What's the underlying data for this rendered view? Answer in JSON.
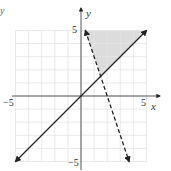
{
  "chart_data": {
    "type": "line",
    "title": "",
    "xlabel": "x",
    "ylabel": "y",
    "xlim": [
      -5,
      5
    ],
    "ylim": [
      -5,
      5
    ],
    "grid": true,
    "x_ticks": [
      "-5",
      "5"
    ],
    "y_ticks": [
      "5",
      "-5"
    ],
    "series": [
      {
        "name": "y = x",
        "style": "solid",
        "points": [
          [
            -5,
            -5
          ],
          [
            5,
            5
          ]
        ]
      },
      {
        "name": "y = -3x + 6",
        "style": "dashed",
        "points": [
          [
            0.333,
            5
          ],
          [
            3.667,
            -5
          ]
        ]
      }
    ],
    "shaded_region": {
      "vertices": [
        [
          0.333,
          5
        ],
        [
          1.5,
          1.5
        ],
        [
          5,
          5
        ]
      ],
      "color": "#dcdcdc"
    },
    "intersection": [
      1.5,
      1.5
    ]
  },
  "labels": {
    "x_axis": "x",
    "y_axis": "y",
    "x_min": "−5",
    "x_max": "5",
    "y_max": "5",
    "y_min": "−5",
    "corner": "y"
  },
  "colors": {
    "line": "#222222",
    "grid": "#e4e4e4",
    "shade": "#dcdcdc",
    "axis": "#444444"
  }
}
